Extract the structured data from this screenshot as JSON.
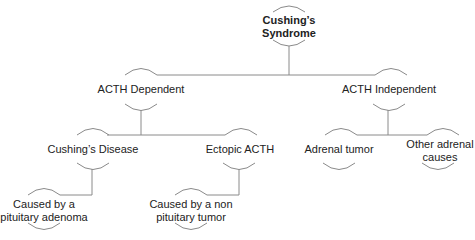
{
  "diagram": {
    "nodes": {
      "root": {
        "label": "Cushing’s\nSyndrome",
        "line1": "Cushing’s",
        "line2": "Syndrome"
      },
      "acth_dependent": {
        "label": "ACTH Dependent"
      },
      "acth_independent": {
        "label": "ACTH Independent"
      },
      "cushings_disease": {
        "label": "Cushing’s Disease"
      },
      "ectopic_acth": {
        "label": "Ectopic ACTH"
      },
      "adrenal_tumor": {
        "label": "Adrenal tumor"
      },
      "other_adrenal": {
        "label": "Other adrenal causes",
        "line1": "Other adrenal",
        "line2": "causes"
      },
      "pituitary_adenoma": {
        "label": "Caused by a pituitary adenoma",
        "line1": "Caused by a",
        "line2": "pituitary adenoma"
      },
      "non_pituitary": {
        "label": "Caused by a non pituitary tumor",
        "line1": "Caused by a non",
        "line2": "pituitary tumor"
      }
    },
    "edges": [
      [
        "root",
        "acth_dependent"
      ],
      [
        "root",
        "acth_independent"
      ],
      [
        "acth_dependent",
        "cushings_disease"
      ],
      [
        "acth_dependent",
        "ectopic_acth"
      ],
      [
        "acth_independent",
        "adrenal_tumor"
      ],
      [
        "acth_independent",
        "other_adrenal"
      ],
      [
        "cushings_disease",
        "pituitary_adenoma"
      ],
      [
        "ectopic_acth",
        "non_pituitary"
      ]
    ],
    "colors": {
      "line": "#8a8a8a",
      "text": "#222222"
    }
  }
}
